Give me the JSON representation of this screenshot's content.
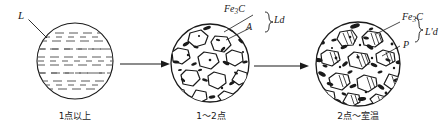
{
  "figure": {
    "background_color": "#ffffff",
    "ink_color": "#1a1a1a",
    "stages": [
      {
        "id": "stage-1",
        "caption": "1点以上",
        "phase_labels": [
          {
            "id": "label-L",
            "text": "L",
            "italic": true
          }
        ],
        "texture": "horizontal-dashed-liquid"
      },
      {
        "id": "stage-2",
        "caption": "1～2点",
        "phase_labels": [
          {
            "id": "label-fe3c-mid",
            "text": "Fe3C",
            "base": "Fe",
            "subscript": "3",
            "tail": "C",
            "italic": true
          },
          {
            "id": "label-A",
            "text": "A",
            "italic": true
          },
          {
            "id": "label-Ld",
            "text": "Ld",
            "italic": true
          }
        ],
        "texture": "white-grains-with-speckles"
      },
      {
        "id": "stage-3",
        "caption": "2点～室温",
        "phase_labels": [
          {
            "id": "label-fe3c-right",
            "text": "Fe3C",
            "base": "Fe",
            "subscript": "3",
            "tail": "C",
            "italic": true
          },
          {
            "id": "label-P",
            "text": "P",
            "italic": true
          },
          {
            "id": "label-Lprime-d",
            "text": "L'd",
            "italic": true
          }
        ],
        "texture": "dark-hatched-grains-dense-speckles"
      }
    ],
    "arrows": [
      {
        "id": "arrow-1",
        "direction": "right"
      },
      {
        "id": "arrow-2",
        "direction": "right"
      }
    ]
  }
}
